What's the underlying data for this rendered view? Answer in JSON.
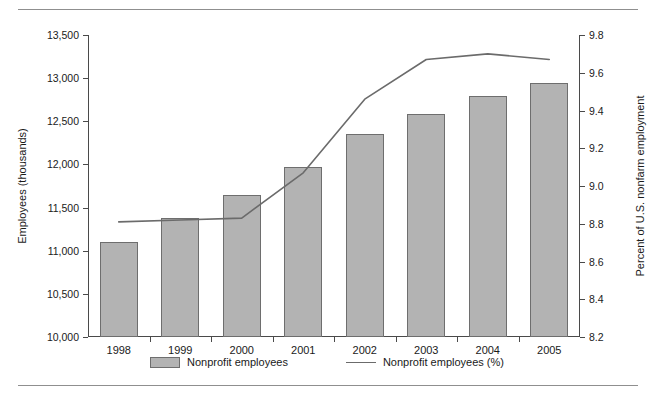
{
  "chart_data": {
    "type": "bar",
    "title": "",
    "categories": [
      "1998",
      "1999",
      "2000",
      "2001",
      "2002",
      "2003",
      "2004",
      "2005"
    ],
    "series": [
      {
        "name": "Nonprofit employees",
        "type": "bar",
        "axis": "left",
        "values": [
          11100,
          11380,
          11650,
          11970,
          12355,
          12585,
          12790,
          12940
        ]
      },
      {
        "name": "Nonprofit employees (%)",
        "type": "line",
        "axis": "right",
        "values": [
          8.81,
          8.82,
          8.83,
          9.07,
          9.46,
          9.67,
          9.7,
          9.67
        ]
      }
    ],
    "xlabel": "",
    "ylabel": "Employees (thousands)",
    "y2label": "Percent of U.S. nonfarm employment",
    "ylim": [
      10000,
      13500
    ],
    "ytick_step": 500,
    "y2lim": [
      8.2,
      9.8
    ],
    "y2tick_step": 0.2,
    "yticks": [
      "10,000",
      "10,500",
      "11,000",
      "11,500",
      "12,000",
      "12,500",
      "13,000",
      "13,500"
    ],
    "y2ticks": [
      "8.2",
      "8.4",
      "8.6",
      "8.8",
      "9.0",
      "9.2",
      "9.4",
      "9.6",
      "9.8"
    ],
    "grid": false,
    "legend_position": "bottom",
    "colors": {
      "bar_fill": "#b3b3b3",
      "bar_edge": "#6e6e6e",
      "line": "#6b6b6b",
      "axis": "#4a4a4a",
      "rule": "#8f8f8f",
      "text": "#1a1a1a"
    }
  },
  "axes": {
    "left_title": "Employees (thousands)",
    "right_title": "Percent of U.S. nonfarm employment"
  },
  "legend": {
    "items": [
      {
        "label": "Nonprofit employees",
        "marker": "bar-swatch"
      },
      {
        "label": "Nonprofit employees (%)",
        "marker": "line-swatch"
      }
    ]
  }
}
